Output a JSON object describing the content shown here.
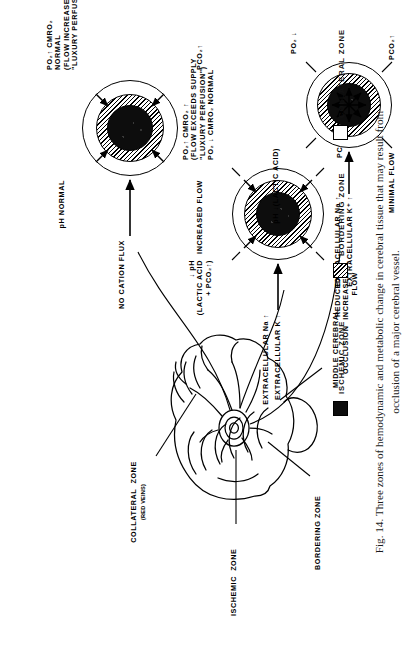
{
  "figure": {
    "number": "Fig. 14.",
    "caption": "Fig. 14.  Three zones of hemodynamic and metabolic change in cerebral tissue that may result from\nocclusion of a major cerebral vessel."
  },
  "brain": {
    "labels": {
      "ischemic_zone": "ISCHEMIC  ZONE",
      "collateral_zone": "COLLATERAL  ZONE",
      "collateral_zone_sub": "(RED VEINS)",
      "bordering_zone": "BORDERING ZONE",
      "middle_cerebral": "MIDDLE CEREBRAL",
      "occlusion": "OCCLUSION"
    }
  },
  "diagrams": [
    {
      "id": "ischemic",
      "name": "ischemic-zone-diagram",
      "labels": {
        "extracellular_na": "EXTRACELLULAR Na ↑",
        "extracellular_k": "EXTRACELLULAR K⁺ ↑",
        "ph": "pH ↓(LACTIC ACID)",
        "po2": "PO₂ ↓",
        "pco2": "PCO₂↑",
        "flow": "MINIMAL FLOW"
      }
    },
    {
      "id": "bordering",
      "name": "bordering-zone-diagram",
      "labels": {
        "extracellular_na": "EXTRACELLULAR Na ↑",
        "extracellular_k": "EXTRACELLULAR K ↑",
        "ph": "↓ pH\n(LACTIC ACID\n + PCO₂↑)",
        "metabolic": "PO₂↑ CMRO₂ ↑\n(FLOW EXCEEDS SUPPLY\n\"LUXURY PERFUSION\")\nPO₂ ↓ CMRO₂ NORMAL",
        "pco2": "PCO₂↑",
        "flow": "REDUCED /\nINCREASED\nFLOW"
      }
    },
    {
      "id": "collateral",
      "name": "collateral-zone-diagram",
      "labels": {
        "cation": "NO CATION FLUX",
        "ph": "pH NORMAL",
        "metabolic": "PO₂↑ CMRO₂\nNORMAL\n(FLOW INCREASED\n\"LUXURY PERFUSION\")",
        "pco2": "PCO₂↑",
        "flow": "INCREASED FLOW"
      }
    }
  ],
  "legend": {
    "items": [
      {
        "label": "ISCHEMIC ZONE",
        "swatch": "black",
        "color": "#0d0d0d"
      },
      {
        "label": "BORDERING ZONE",
        "swatch": "hatch",
        "color": "#000000"
      },
      {
        "label": "COLLATERAL ZONE",
        "swatch": "white",
        "color": "#ffffff"
      }
    ]
  }
}
